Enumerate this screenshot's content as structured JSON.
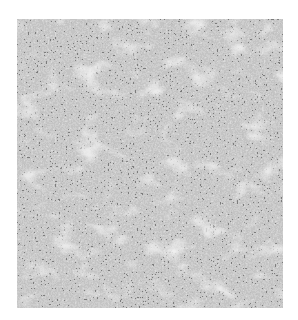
{
  "image": {
    "kind": "grayscale histology micrograph",
    "description": "Dense sheet of small dark round cell nuclei with lighter branching stromal/vascular streaks",
    "colors": {
      "background": "#ffffff",
      "tissue_base": "#9a9a9a",
      "nuclei": "#2e2e2e",
      "stroma": "#d6d6d6"
    }
  }
}
